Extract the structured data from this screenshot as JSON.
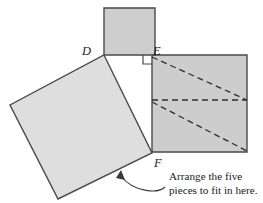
{
  "figure": {
    "background_color": "#ffffff",
    "caption": {
      "line1": "Arrange the five",
      "line2": "pieces to fit in here."
    },
    "labels": {
      "d": "D",
      "e": "E",
      "f": "F"
    },
    "colors": {
      "small_square_fill": "#cecece",
      "large_square_fill": "#cdcdcd",
      "tilted_square_fill": "#dedede",
      "stroke": "#4a4a4a",
      "dashed_stroke": "#2e2e2e",
      "text": "#1c1c1c",
      "arrow": "#3a3a3a"
    },
    "shapes": {
      "small_square": {
        "name": "small-square",
        "points": "104,8 155,8 155,55 104,55"
      },
      "large_square": {
        "name": "large-square",
        "points": "152,55 247,55 247,152 152,152"
      },
      "tilted_square": {
        "name": "tilted-square",
        "points": "104,55 152,153 58,199 10,105"
      },
      "right_angle_mark": {
        "name": "right-angle-mark",
        "points": "143,55 143,64 152,64"
      },
      "dashed_midline": {
        "name": "dashed-horizontal-midline",
        "x1": 152,
        "y1": 100,
        "x2": 247,
        "y2": 100
      },
      "dashed_diagonal_upper": {
        "name": "dashed-diagonal-upper",
        "x1": 152,
        "y1": 57,
        "x2": 247,
        "y2": 100
      },
      "dashed_diagonal_lower": {
        "name": "dashed-diagonal-lower",
        "x1": 152,
        "y1": 102,
        "x2": 247,
        "y2": 151
      },
      "curved_arrow": {
        "name": "curved-arrow",
        "path": "M 165 187 C 158 194, 133 192, 121 176",
        "arrowhead": "121,170 125,180 116,178"
      }
    },
    "label_positions": {
      "d": {
        "x": 93,
        "y": 55
      },
      "e": {
        "x": 153,
        "y": 55
      },
      "f": {
        "x": 154,
        "y": 166
      }
    },
    "caption_position": {
      "x": 169,
      "y1": 180,
      "y2": 194
    }
  }
}
